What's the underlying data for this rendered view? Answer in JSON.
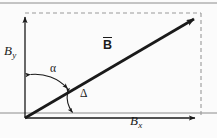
{
  "figure": {
    "kind": "vector-decomposition-diagram",
    "background_color": "#fbfbfb",
    "stroke_color": "#1a1a1a",
    "dashed_color": "#9a9a9a",
    "rule_color": "#8c8c8c"
  },
  "labels": {
    "y_component": {
      "base": "B",
      "subscript": "y",
      "text": "By"
    },
    "x_component": {
      "base": "B",
      "subscript": "x",
      "text": "Bx"
    },
    "vector": {
      "text": "B",
      "notation": "overbar-bold"
    },
    "angle_alpha": {
      "text": "α"
    },
    "angle_delta": {
      "text": "Δ"
    }
  },
  "geometry": {
    "origin": {
      "x": 25,
      "y": 118
    },
    "y_axis_tip": {
      "x": 25,
      "y": 12
    },
    "x_axis_tip": {
      "x": 200,
      "y": 118
    },
    "vector_tip": {
      "x": 200,
      "y": 14
    },
    "dashed_top": {
      "x1": 25,
      "y1": 13,
      "x2": 201,
      "y2": 13
    },
    "dashed_right": {
      "x1": 201,
      "y1": 13,
      "x2": 201,
      "y2": 118
    }
  },
  "rules": {
    "top_rule_y": 3,
    "bottom_rule_y": 113
  },
  "icons": {
    "arrowhead": "arrowhead-icon"
  }
}
